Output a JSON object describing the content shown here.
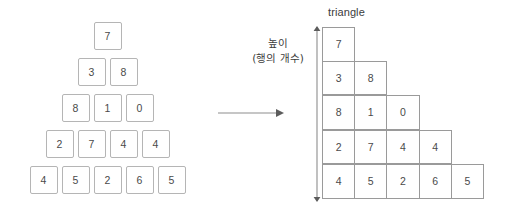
{
  "canvas": {
    "width": 528,
    "height": 223,
    "background": "#ffffff",
    "box_border_color": "#b5b5b5",
    "grid_border_color": "#9a9a9a",
    "text_color": "#4a4a4a",
    "arrow_color": "#6f6f6f"
  },
  "pyramid": {
    "name": "centered-number-pyramid",
    "rows": [
      [
        "7"
      ],
      [
        "3",
        "8"
      ],
      [
        "8",
        "1",
        "0"
      ],
      [
        "2",
        "7",
        "4",
        "4"
      ],
      [
        "4",
        "5",
        "2",
        "6",
        "5"
      ]
    ]
  },
  "transform_arrow": {
    "direction": "right",
    "label": ""
  },
  "triangle": {
    "label": "triangle",
    "rows": [
      [
        "7"
      ],
      [
        "3",
        "8"
      ],
      [
        "8",
        "1",
        "0"
      ],
      [
        "2",
        "7",
        "4",
        "4"
      ],
      [
        "4",
        "5",
        "2",
        "6",
        "5"
      ]
    ]
  },
  "height_measure": {
    "caption_line1": "높이",
    "caption_line2": "(행의 개수)",
    "direction": "double-vertical",
    "value": 5
  },
  "chart_data": {
    "type": "table",
    "title": "triangle",
    "rows": [
      [
        "7"
      ],
      [
        "3",
        "8"
      ],
      [
        "8",
        "1",
        "0"
      ],
      [
        "2",
        "7",
        "4",
        "4"
      ],
      [
        "4",
        "5",
        "2",
        "6",
        "5"
      ]
    ],
    "row_count": 5,
    "annotations": [
      "높이",
      "(행의 개수)",
      "triangle"
    ]
  }
}
